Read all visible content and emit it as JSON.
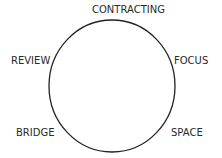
{
  "diagram": {
    "type": "cycle",
    "shape": "circle",
    "stroke_color": "#222222",
    "text_color": "#2a2a2a",
    "background": "#ffffff",
    "stages": [
      {
        "label": "CONTRACTING",
        "position": "top"
      },
      {
        "label": "FOCUS",
        "position": "upper-right"
      },
      {
        "label": "SPACE",
        "position": "lower-right"
      },
      {
        "label": "BRIDGE",
        "position": "lower-left"
      },
      {
        "label": "REVIEW",
        "position": "upper-left"
      }
    ]
  }
}
